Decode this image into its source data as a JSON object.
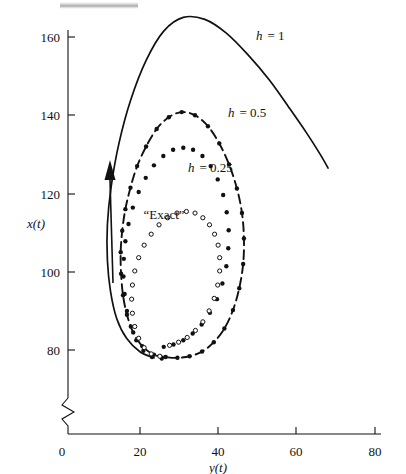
{
  "figure": {
    "background_color": "#ffffff",
    "ink_color": "#111111",
    "axis_break_note": "zigzag break on vertical axis near origin"
  },
  "axes": {
    "x": {
      "label": "y(t)",
      "ticks": [
        "0",
        "20",
        "40",
        "60",
        "80"
      ],
      "tick_values": [
        0,
        20,
        40,
        60,
        80
      ],
      "range": [
        0,
        80
      ]
    },
    "y": {
      "label": "x(t)",
      "ticks": [
        "80",
        "100",
        "120",
        "140",
        "160"
      ],
      "tick_values": [
        80,
        100,
        120,
        140,
        160
      ],
      "range": [
        72,
        168
      ]
    }
  },
  "annotations": {
    "h1": "h = 1",
    "h1_var": "h",
    "h1_val": "= 1",
    "h05_var": "h",
    "h05_val": "= 0.5",
    "h025_var": "h",
    "h025_val": "= 0.25",
    "exact": "“Exact”",
    "arrow": "direction-of-travel arrow"
  },
  "chart_data": {
    "type": "scatter",
    "title": "",
    "xlabel": "y(t)",
    "ylabel": "x(t)",
    "xlim": [
      0,
      80
    ],
    "ylim": [
      72,
      168
    ],
    "grid": false,
    "legend": "inline curve labels",
    "series": [
      {
        "name": "h = 1",
        "style": "solid-line",
        "marker": "none",
        "points": [
          [
            23.5,
            78.0
          ],
          [
            20.0,
            79.5
          ],
          [
            16.5,
            83.0
          ],
          [
            14.0,
            88.0
          ],
          [
            12.4,
            95.0
          ],
          [
            11.6,
            103.0
          ],
          [
            11.6,
            112.0
          ],
          [
            12.6,
            122.0
          ],
          [
            14.6,
            133.0
          ],
          [
            17.6,
            144.0
          ],
          [
            21.5,
            154.0
          ],
          [
            26.0,
            161.5
          ],
          [
            31.0,
            165.0
          ],
          [
            36.5,
            164.5
          ],
          [
            42.0,
            161.0
          ],
          [
            47.5,
            155.5
          ],
          [
            53.0,
            149.0
          ],
          [
            58.0,
            142.0
          ],
          [
            62.5,
            135.5
          ],
          [
            66.0,
            130.0
          ],
          [
            68.0,
            126.5
          ]
        ]
      },
      {
        "name": "h = 0.5",
        "style": "dashed-line-with-dots",
        "marker": "filled-circle",
        "points": [
          [
            26.5,
            78.2
          ],
          [
            23.5,
            78.8
          ],
          [
            20.5,
            81.0
          ],
          [
            18.2,
            84.5
          ],
          [
            16.6,
            89.0
          ],
          [
            15.6,
            94.0
          ],
          [
            15.1,
            99.5
          ],
          [
            15.0,
            105.0
          ],
          [
            15.4,
            110.5
          ],
          [
            16.2,
            116.0
          ],
          [
            17.5,
            121.5
          ],
          [
            19.2,
            127.0
          ],
          [
            21.5,
            132.0
          ],
          [
            24.2,
            136.5
          ],
          [
            27.3,
            139.5
          ],
          [
            30.6,
            140.8
          ],
          [
            34.0,
            140.0
          ],
          [
            37.3,
            137.2
          ],
          [
            40.2,
            132.8
          ],
          [
            42.7,
            127.4
          ],
          [
            44.7,
            121.3
          ],
          [
            46.0,
            115.0
          ],
          [
            46.5,
            108.5
          ],
          [
            46.3,
            102.0
          ],
          [
            45.3,
            95.8
          ],
          [
            43.7,
            90.2
          ],
          [
            41.5,
            85.5
          ],
          [
            38.8,
            82.0
          ],
          [
            35.8,
            79.6
          ],
          [
            32.6,
            78.4
          ],
          [
            29.5,
            78.0
          ]
        ]
      },
      {
        "name": "h = 0.25",
        "style": "dots-only",
        "marker": "filled-circle",
        "points": [
          [
            25.5,
            77.8
          ],
          [
            23.0,
            78.2
          ],
          [
            20.8,
            79.8
          ],
          [
            19.0,
            82.5
          ],
          [
            17.6,
            86.0
          ],
          [
            16.6,
            90.0
          ],
          [
            16.0,
            94.3
          ],
          [
            15.7,
            98.8
          ],
          [
            15.8,
            103.3
          ],
          [
            16.2,
            107.8
          ],
          [
            17.0,
            112.2
          ],
          [
            18.1,
            116.4
          ],
          [
            19.6,
            120.4
          ],
          [
            21.4,
            124.0
          ],
          [
            23.5,
            127.2
          ],
          [
            25.9,
            129.6
          ],
          [
            28.4,
            131.2
          ],
          [
            31.0,
            131.7
          ],
          [
            33.5,
            131.2
          ],
          [
            35.9,
            129.6
          ],
          [
            38.0,
            127.0
          ],
          [
            39.8,
            123.6
          ],
          [
            41.2,
            119.6
          ],
          [
            42.1,
            115.2
          ],
          [
            42.6,
            110.6
          ],
          [
            42.5,
            106.0
          ],
          [
            42.0,
            101.4
          ],
          [
            41.0,
            97.0
          ],
          [
            39.6,
            93.0
          ],
          [
            37.8,
            89.5
          ],
          [
            35.7,
            86.5
          ],
          [
            33.4,
            84.2
          ],
          [
            31.0,
            82.5
          ],
          [
            28.5,
            81.4
          ],
          [
            26.0,
            80.8
          ]
        ]
      },
      {
        "name": "“Exact”",
        "style": "dots-only",
        "marker": "open-circle",
        "points": [
          [
            25.0,
            78.4
          ],
          [
            22.8,
            79.0
          ],
          [
            21.0,
            80.6
          ],
          [
            19.6,
            83.0
          ],
          [
            18.6,
            86.0
          ],
          [
            18.0,
            89.4
          ],
          [
            17.8,
            93.0
          ],
          [
            18.0,
            96.6
          ],
          [
            18.6,
            100.2
          ],
          [
            19.6,
            103.6
          ],
          [
            21.0,
            106.8
          ],
          [
            22.8,
            109.6
          ],
          [
            24.8,
            112.0
          ],
          [
            27.0,
            113.8
          ],
          [
            29.4,
            115.0
          ],
          [
            31.8,
            115.4
          ],
          [
            34.0,
            115.0
          ],
          [
            36.0,
            113.8
          ],
          [
            37.7,
            112.0
          ],
          [
            39.0,
            109.6
          ],
          [
            39.9,
            106.8
          ],
          [
            40.3,
            103.6
          ],
          [
            40.3,
            100.2
          ],
          [
            39.8,
            96.6
          ],
          [
            38.9,
            93.2
          ],
          [
            37.6,
            90.0
          ],
          [
            36.0,
            87.2
          ],
          [
            34.1,
            85.0
          ],
          [
            32.0,
            83.2
          ],
          [
            29.8,
            82.0
          ],
          [
            27.5,
            81.2
          ]
        ]
      }
    ]
  }
}
